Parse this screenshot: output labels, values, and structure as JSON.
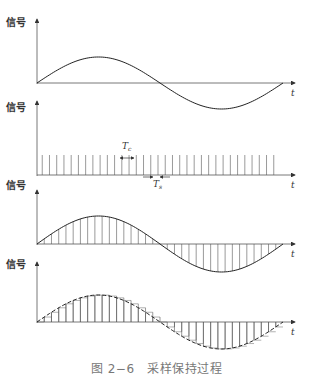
{
  "figure": {
    "caption": "图 2−6　采样保持过程",
    "colors": {
      "line": "#222222",
      "axis": "#555555",
      "caption": "#777777"
    }
  },
  "panels": [
    {
      "id": "analog-signal",
      "y_label": "信号",
      "x_label": "t",
      "description": "continuous sine wave"
    },
    {
      "id": "sampling-pulses",
      "y_label": "信号",
      "x_label": "t",
      "description": "periodic sampling pulse train",
      "annotations": [
        {
          "text": "T",
          "sub": "c",
          "meaning": "pulse width"
        },
        {
          "text": "T",
          "sub": "s",
          "meaning": "sampling period"
        }
      ]
    },
    {
      "id": "sampled-signal",
      "y_label": "信号",
      "x_label": "t",
      "description": "sine wave with vertical sample lines"
    },
    {
      "id": "held-signal",
      "y_label": "信号",
      "x_label": "t",
      "description": "dashed sine with staircase hold steps"
    }
  ],
  "chart_data": {
    "type": "line",
    "xlabel": "t",
    "ylabel": "信号",
    "signal": "one full period of a sine wave",
    "sample_count": 34,
    "panels": [
      "continuous signal",
      "sampling pulse train (Tc, Ts)",
      "sampled signal",
      "sample-and-hold signal"
    ]
  }
}
